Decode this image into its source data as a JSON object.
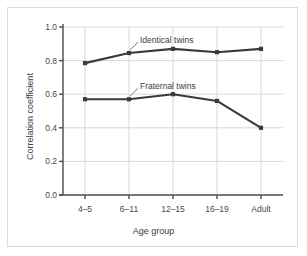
{
  "chart_data": {
    "type": "line",
    "title": "",
    "subtitle": "",
    "xlabel": "Age group",
    "ylabel": "Correlation coefficient",
    "categories": [
      "4–5",
      "6–11",
      "12–15",
      "16–19",
      "Adult"
    ],
    "xtick_labels": [
      "4–5",
      "6–11",
      "12–15",
      "16–19",
      "Adult"
    ],
    "ytick_labels": [
      "0.0",
      "0.2",
      "0.4",
      "0.6",
      "0.8",
      "1.0"
    ],
    "ytick_values": [
      0.0,
      0.2,
      0.4,
      0.6,
      0.8,
      1.0
    ],
    "ylim": [
      0.0,
      1.0
    ],
    "grid": "horizontal-and-vertical",
    "legend_position": "inline-annotations",
    "series": [
      {
        "name": "Identical twins",
        "values": [
          0.785,
          0.845,
          0.87,
          0.85,
          0.87
        ],
        "color": "#3a3a3a",
        "marker": "square"
      },
      {
        "name": "Fraternal twins",
        "values": [
          0.57,
          0.57,
          0.6,
          0.56,
          0.4
        ],
        "color": "#3a3a3a",
        "marker": "square"
      }
    ],
    "annotations": [
      {
        "text": "Identical twins",
        "points_to_series": "Identical twins",
        "points_to_category": "6–11"
      },
      {
        "text": "Fraternal twins",
        "points_to_series": "Fraternal twins",
        "points_to_category": "6–11"
      }
    ]
  },
  "colors": {
    "line": "#3a3a3a",
    "gridline": "#d8d8d8",
    "axis": "#4a4a4a",
    "text": "#4a4a4a",
    "frame_border": "#dcdcdc",
    "background": "#ffffff"
  }
}
